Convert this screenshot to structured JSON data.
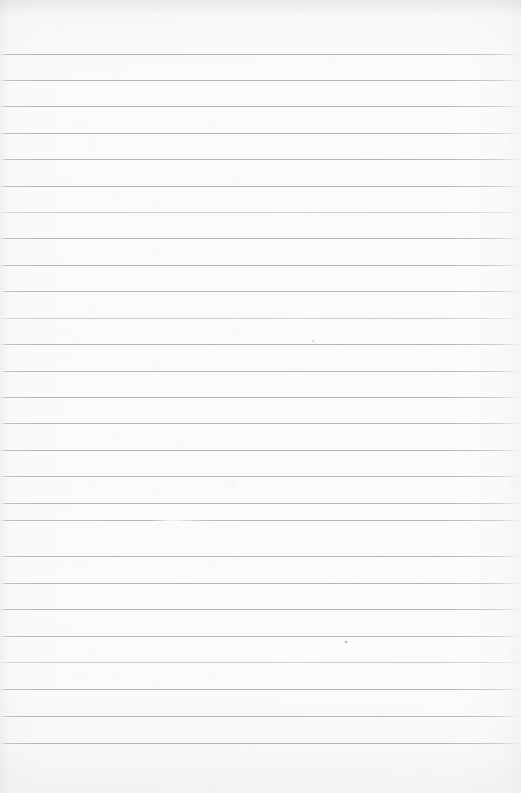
{
  "document": {
    "kind": "scanned-blank-ruled-notebook-page",
    "title": "Blank ruled notebook page",
    "page_width": 521,
    "page_height": 793,
    "has_text_content": false,
    "text_content": "",
    "paper_color": "#fbfbfc",
    "rule_color": "#96989f",
    "edge_shadow_color": "#f2f2f3"
  },
  "ruling": {
    "style": "horizontal-lined",
    "line_count": 27,
    "first_line_y": 54,
    "line_spacing": 26.5,
    "line_thickness": 1,
    "line_start_x": 0,
    "line_end_x": 515,
    "top_margin": 54,
    "bottom_margin": 50,
    "has_vertical_margin_rule": false,
    "lines": [
      {
        "index": 1,
        "y": 54,
        "variant": "normal"
      },
      {
        "index": 2,
        "y": 80,
        "variant": "normal"
      },
      {
        "index": 3,
        "y": 106,
        "variant": "normal"
      },
      {
        "index": 4,
        "y": 133,
        "variant": "normal"
      },
      {
        "index": 5,
        "y": 159,
        "variant": "normal"
      },
      {
        "index": 6,
        "y": 186,
        "variant": "normal"
      },
      {
        "index": 7,
        "y": 212,
        "variant": "faint"
      },
      {
        "index": 8,
        "y": 238,
        "variant": "normal"
      },
      {
        "index": 9,
        "y": 265,
        "variant": "normal"
      },
      {
        "index": 10,
        "y": 291,
        "variant": "normal"
      },
      {
        "index": 11,
        "y": 318,
        "variant": "faint"
      },
      {
        "index": 12,
        "y": 344,
        "variant": "normal"
      },
      {
        "index": 13,
        "y": 371,
        "variant": "normal"
      },
      {
        "index": 14,
        "y": 397,
        "variant": "normal"
      },
      {
        "index": 15,
        "y": 423,
        "variant": "normal"
      },
      {
        "index": 16,
        "y": 450,
        "variant": "normal"
      },
      {
        "index": 17,
        "y": 476,
        "variant": "normal"
      },
      {
        "index": 18,
        "y": 503,
        "variant": "normal"
      },
      {
        "index": 19,
        "y": 520,
        "variant": "broken"
      },
      {
        "index": 20,
        "y": 556,
        "variant": "normal"
      },
      {
        "index": 21,
        "y": 583,
        "variant": "normal"
      },
      {
        "index": 22,
        "y": 609,
        "variant": "normal"
      },
      {
        "index": 23,
        "y": 636,
        "variant": "normal"
      },
      {
        "index": 24,
        "y": 662,
        "variant": "faint"
      },
      {
        "index": 25,
        "y": 689,
        "variant": "normal"
      },
      {
        "index": 26,
        "y": 716,
        "variant": "normal"
      },
      {
        "index": 27,
        "y": 743,
        "variant": "normal"
      }
    ]
  },
  "artifacts": {
    "specks": [
      {
        "name": "speck-mid-right",
        "x": 345,
        "y": 641,
        "size": 2.0,
        "soft": false
      },
      {
        "name": "speck-upper-mid",
        "x": 312,
        "y": 340,
        "size": 1.6,
        "soft": true
      },
      {
        "name": "speck-lower-left",
        "x": 233,
        "y": 699,
        "size": 1.4,
        "soft": true
      }
    ]
  }
}
